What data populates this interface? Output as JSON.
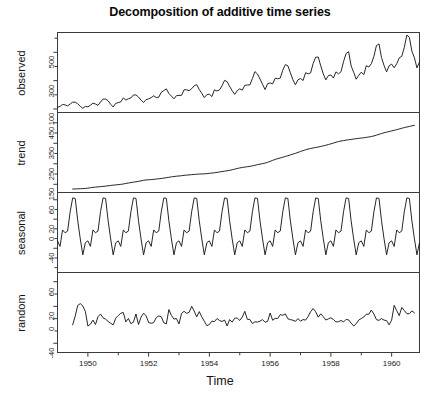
{
  "chart_data": {
    "type": "line",
    "title": "Decomposition of additive time series",
    "xlabel": "Time",
    "subplot_count": 4,
    "xlim": [
      1949.0,
      1960.917
    ],
    "xticks": [
      1950,
      1952,
      1954,
      1956,
      1958,
      1960
    ],
    "xtick_labels": [
      "1950",
      "1952",
      "1954",
      "1956",
      "1958",
      "1960"
    ],
    "x_minor_ticks": [
      1951,
      1953,
      1955,
      1957,
      1959
    ],
    "grid": false,
    "legend": null,
    "dataset_description": "Monthly totals of international airline passengers, Jan 1949 - Dec 1960, decomposed additively into trend, seasonal and random components.",
    "panels": [
      {
        "name": "observed",
        "ylabel": "observed",
        "ylim": [
          75,
          640
        ],
        "yticks": [
          100,
          300,
          500
        ],
        "ytick_labels": [
          "100",
          "300",
          "500"
        ],
        "y_minor_ticks": [
          200,
          400,
          600
        ],
        "x_start": 1949.0,
        "x_step": 0.08333333,
        "values": [
          112,
          118,
          132,
          129,
          121,
          135,
          148,
          148,
          136,
          119,
          104,
          118,
          115,
          126,
          141,
          135,
          125,
          149,
          170,
          170,
          158,
          133,
          114,
          140,
          145,
          150,
          178,
          163,
          172,
          178,
          199,
          199,
          184,
          162,
          146,
          166,
          171,
          180,
          193,
          181,
          183,
          218,
          230,
          242,
          209,
          191,
          172,
          194,
          196,
          196,
          236,
          235,
          229,
          243,
          264,
          272,
          237,
          211,
          180,
          201,
          204,
          188,
          235,
          227,
          234,
          264,
          302,
          293,
          259,
          229,
          203,
          229,
          242,
          233,
          267,
          269,
          270,
          315,
          364,
          347,
          312,
          274,
          237,
          278,
          284,
          277,
          317,
          313,
          318,
          374,
          413,
          405,
          355,
          306,
          271,
          306,
          315,
          301,
          356,
          348,
          355,
          422,
          465,
          467,
          404,
          347,
          305,
          336,
          340,
          318,
          362,
          348,
          363,
          435,
          491,
          505,
          404,
          359,
          310,
          337,
          360,
          342,
          406,
          396,
          420,
          472,
          548,
          559,
          463,
          407,
          362,
          405,
          417,
          391,
          419,
          461,
          472,
          535,
          622,
          606,
          508,
          461,
          390,
          432
        ]
      },
      {
        "name": "trend",
        "ylabel": "trend",
        "ylim": [
          110,
          500
        ],
        "yticks": [
          150,
          250,
          350,
          450
        ],
        "ytick_labels": [
          "150",
          "250",
          "350",
          "450"
        ],
        "y_minor_ticks": [
          200,
          300,
          400
        ],
        "x_start": 1949.5,
        "x_step": 0.08333333,
        "values": [
          126.79,
          127.25,
          127.96,
          128.58,
          129.0,
          129.75,
          131.25,
          133.08,
          134.92,
          136.42,
          137.42,
          138.54,
          139.79,
          141.13,
          142.67,
          144.21,
          145.75,
          147.25,
          148.46,
          149.67,
          151.54,
          154.04,
          156.29,
          158.42,
          160.46,
          162.42,
          164.42,
          166.75,
          169.33,
          171.25,
          172.08,
          172.96,
          174.0,
          175.46,
          177.04,
          178.42,
          180.17,
          182.17,
          184.25,
          186.21,
          188.0,
          189.46,
          190.58,
          191.96,
          193.5,
          194.83,
          195.83,
          196.88,
          198.04,
          199.08,
          199.96,
          200.5,
          201.0,
          201.96,
          203.42,
          204.79,
          206.25,
          208.04,
          210.0,
          211.96,
          213.96,
          215.92,
          218.0,
          220.92,
          224.04,
          227.04,
          229.79,
          232.0,
          233.92,
          235.63,
          237.5,
          240.0,
          242.67,
          245.79,
          248.25,
          250.54,
          253.5,
          257.13,
          261.83,
          266.67,
          271.25,
          275.21,
          278.5,
          281.96,
          285.75,
          289.33,
          293.25,
          297.17,
          301.0,
          305.46,
          309.96,
          314.29,
          318.42,
          321.83,
          324.42,
          327.08,
          329.54,
          331.79,
          334.46,
          337.54,
          340.54,
          343.75,
          347.25,
          351.08,
          354.92,
          358.38,
          361.04,
          363.25,
          365.38,
          367.17,
          368.75,
          370.54,
          372.38,
          374.04,
          375.46,
          377.04,
          378.83,
          380.67,
          383.04,
          385.79,
          389.46,
          393.58,
          397.46,
          401.08,
          404.29,
          407.17,
          410.25,
          413.21,
          416.33,
          419.75,
          423.17,
          426.42,
          429.29,
          432.0,
          434.92,
          437.67
        ]
      },
      {
        "name": "seasonal",
        "ylabel": "seasonal",
        "ylim": [
          -90,
          75
        ],
        "yticks": [
          60,
          20,
          0,
          -40
        ],
        "ytick_labels": [
          "60",
          "20",
          "0",
          "-40"
        ],
        "y_minor_ticks": [
          40,
          -20,
          -60,
          -80
        ],
        "x_start": 1949.0,
        "x_step": 0.08333333,
        "monthly_pattern": [
          -24.75,
          -36.19,
          -2.24,
          -8.04,
          -4.51,
          35.4,
          63.83,
          62.82,
          16.52,
          -20.64,
          -53.59,
          -28.62
        ],
        "repeats": 12
      },
      {
        "name": "random",
        "ylabel": "random",
        "ylim": [
          -55,
          75
        ],
        "yticks": [
          60,
          20,
          0,
          -40
        ],
        "ytick_labels": [
          "60",
          "20",
          "0",
          "-40"
        ],
        "y_minor_ticks": [
          40,
          -20
        ],
        "x_start": 1949.5,
        "x_step": 0.08333333,
        "values": [
          -10.0,
          4.2,
          21.6,
          24.4,
          20.6,
          11.9,
          -12.0,
          -9.1,
          -2.4,
          -9.5,
          3.3,
          7.5,
          1.4,
          -0.9,
          -4.6,
          -7.3,
          -10.2,
          0.9,
          5.1,
          8.7,
          10.0,
          -5.3,
          0.3,
          -8.2,
          -5.7,
          7.6,
          -9.6,
          2.4,
          8.8,
          4.6,
          -6.3,
          -7.6,
          -6.4,
          1.8,
          4.4,
          3.0,
          -6.6,
          -8.6,
          14.8,
          5.2,
          -0.6,
          0.1,
          -8.6,
          8.4,
          12.0,
          8.6,
          10.2,
          20.1,
          12.4,
          2.9,
          11.5,
          2.9,
          -4.2,
          -11.4,
          -9.6,
          -4.0,
          -4.9,
          0.3,
          -3.0,
          -4.6,
          -2.3,
          -11.8,
          -1.6,
          -5.6,
          0.8,
          0.9,
          -2.8,
          2.6,
          11.9,
          -1.2,
          -1.3,
          -8.1,
          -5.1,
          -5.5,
          -4.1,
          -1.5,
          -5.8,
          -4.5,
          9.2,
          -2.6,
          0.5,
          0.2,
          6.6,
          5.5,
          7.7,
          -0.2,
          -1.5,
          -2.5,
          -4.4,
          0.1,
          -4.1,
          -1.4,
          -2.4,
          3.5,
          11.3,
          16.4,
          11.2,
          2.4,
          7.9,
          3.1,
          -2.2,
          -0.4,
          1.5,
          -1.4,
          -5.3,
          -4.9,
          -2.9,
          -5.4,
          -1.3,
          -2.0,
          -7.3,
          -12.0,
          -8.3,
          -2.3,
          0.2,
          2.7,
          7.3,
          7.1,
          14.0,
          7.4,
          -1.7,
          -2.8,
          0.1,
          -2.4,
          -3.1,
          -10.1,
          -2.5,
          21.6,
          13.0,
          4.9,
          18.2,
          13.3,
          8.0,
          8.0,
          12.6,
          9.5
        ]
      }
    ]
  },
  "axis": {
    "time_label": "Time"
  }
}
